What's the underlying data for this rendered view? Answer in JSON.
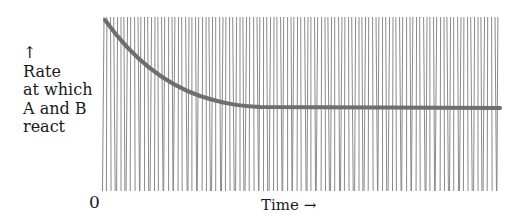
{
  "chart_data": {
    "type": "line",
    "title": "",
    "xlabel": "Time →",
    "ylabel": "↑ Rate at which A and B react",
    "x_origin_label": "0",
    "series": [
      {
        "name": "Rate at which A and B react",
        "x": [
          0,
          0.05,
          0.1,
          0.15,
          0.2,
          0.25,
          0.3,
          0.35,
          0.4,
          0.5,
          0.6,
          0.7,
          0.8,
          0.9,
          1.0
        ],
        "values": [
          1.0,
          0.8,
          0.65,
          0.55,
          0.5,
          0.48,
          0.47,
          0.47,
          0.46,
          0.46,
          0.46,
          0.46,
          0.46,
          0.46,
          0.46
        ]
      }
    ],
    "grid": false,
    "legend": null
  },
  "labels": {
    "arrow_up": "↑",
    "y_line1": "Rate",
    "y_line2": "at which",
    "y_line3": "A and B",
    "y_line4": "react",
    "zero": "0",
    "x_axis": "Time →"
  },
  "colors": {
    "hatch": "#8a8a8a",
    "curve": "#6e6e6e",
    "text": "#1a1a1a"
  }
}
